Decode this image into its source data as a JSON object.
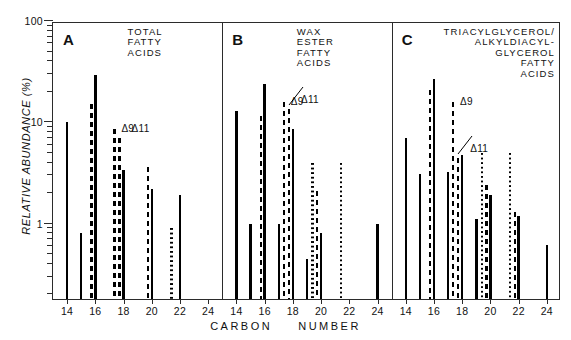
{
  "figure": {
    "ylabel": "RELATIVE ABUNDANCE (%)",
    "xlabel_left": "CARBON",
    "xlabel_right": "NUMBER"
  },
  "axes": {
    "y_major_labels": [
      "100",
      "10",
      "1"
    ],
    "y_major_values": [
      100,
      10,
      1
    ],
    "ylim": [
      0.18,
      100
    ],
    "y_scale": "log",
    "x_tick_labels": [
      "14",
      "16",
      "18",
      "20",
      "22",
      "24"
    ],
    "x_tick_values": [
      14,
      16,
      18,
      20,
      22,
      24
    ],
    "xlim": [
      13.0,
      25.0
    ]
  },
  "annotations": {
    "delta9": "Δ9",
    "delta11": "Δ11"
  },
  "panels": [
    {
      "letter": "A",
      "title": "TOTAL\nFATTY\nACIDS",
      "title_align": "left"
    },
    {
      "letter": "B",
      "title": "WAX\nESTER\nFATTY\nACIDS",
      "title_align": "left"
    },
    {
      "letter": "C",
      "title": "TRIACYLGLYCEROL/\nALKYLDIACYL-\nGLYCEROL\nFATTY\nACIDS",
      "title_align": "right"
    }
  ],
  "chart_data": {
    "type": "bar",
    "xlabel": "CARBON NUMBER",
    "ylabel": "RELATIVE ABUNDANCE (%)",
    "yscale": "log",
    "ylim": [
      0.18,
      100
    ],
    "xlim": [
      13.0,
      25.0
    ],
    "grid": false,
    "legend": null,
    "panels": [
      {
        "letter": "A",
        "name": "TOTAL FATTY ACIDS",
        "bars": [
          {
            "x": 14.0,
            "value": 10.0,
            "style": "solid"
          },
          {
            "x": 15.0,
            "value": 0.8,
            "style": "solid"
          },
          {
            "x": 15.72,
            "value": 15.0,
            "style": "dashed"
          },
          {
            "x": 16.0,
            "value": 29.0,
            "style": "solid"
          },
          {
            "x": 17.35,
            "value": 8.5,
            "style": "dashed"
          },
          {
            "x": 17.72,
            "value": 7.0,
            "style": "dashed"
          },
          {
            "x": 18.0,
            "value": 3.4,
            "style": "solid"
          },
          {
            "x": 19.72,
            "value": 3.6,
            "style": "dashed"
          },
          {
            "x": 20.0,
            "value": 2.2,
            "style": "solid"
          },
          {
            "x": 21.4,
            "value": 0.9,
            "style": "dotted"
          },
          {
            "x": 22.0,
            "value": 1.9,
            "style": "solid"
          }
        ]
      },
      {
        "letter": "B",
        "name": "WAX ESTER FATTY ACIDS",
        "bars": [
          {
            "x": 14.0,
            "value": 13.0,
            "style": "solid"
          },
          {
            "x": 15.0,
            "value": 1.0,
            "style": "solid"
          },
          {
            "x": 15.72,
            "value": 11.5,
            "style": "dashed"
          },
          {
            "x": 16.0,
            "value": 24.0,
            "style": "solid"
          },
          {
            "x": 17.0,
            "value": 1.0,
            "style": "solid"
          },
          {
            "x": 17.35,
            "value": 16.0,
            "style": "dashed"
          },
          {
            "x": 17.72,
            "value": 13.5,
            "style": "dashed"
          },
          {
            "x": 18.0,
            "value": 8.5,
            "style": "solid"
          },
          {
            "x": 19.0,
            "value": 0.45,
            "style": "solid"
          },
          {
            "x": 19.4,
            "value": 4.0,
            "style": "dotted"
          },
          {
            "x": 19.72,
            "value": 2.1,
            "style": "dashed"
          },
          {
            "x": 20.0,
            "value": 0.8,
            "style": "solid"
          },
          {
            "x": 21.4,
            "value": 4.0,
            "style": "dotted"
          },
          {
            "x": 24.0,
            "value": 1.0,
            "style": "solid"
          }
        ]
      },
      {
        "letter": "C",
        "name": "TRIACYLGLYCEROL/ALKYLDIACYLGLYCEROL FATTY ACIDS",
        "bars": [
          {
            "x": 14.0,
            "value": 7.0,
            "style": "solid"
          },
          {
            "x": 15.0,
            "value": 3.1,
            "style": "solid"
          },
          {
            "x": 15.72,
            "value": 21.0,
            "style": "dashed"
          },
          {
            "x": 16.0,
            "value": 27.0,
            "style": "solid"
          },
          {
            "x": 17.0,
            "value": 3.2,
            "style": "solid"
          },
          {
            "x": 17.35,
            "value": 16.0,
            "style": "dashed"
          },
          {
            "x": 17.72,
            "value": 4.4,
            "style": "dashed"
          },
          {
            "x": 18.0,
            "value": 4.8,
            "style": "solid"
          },
          {
            "x": 19.0,
            "value": 1.1,
            "style": "solid"
          },
          {
            "x": 19.4,
            "value": 5.0,
            "style": "dotted"
          },
          {
            "x": 19.72,
            "value": 2.4,
            "style": "dashed"
          },
          {
            "x": 20.0,
            "value": 1.9,
            "style": "solid"
          },
          {
            "x": 21.4,
            "value": 5.0,
            "style": "dotted"
          },
          {
            "x": 21.72,
            "value": 1.3,
            "style": "dashed"
          },
          {
            "x": 22.0,
            "value": 1.2,
            "style": "solid"
          },
          {
            "x": 24.0,
            "value": 0.62,
            "style": "solid"
          }
        ]
      }
    ]
  }
}
